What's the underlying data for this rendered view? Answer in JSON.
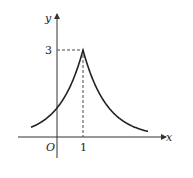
{
  "diagram": {
    "type": "function-graph",
    "function": "y = 3^(1-|x-1|)",
    "axes": {
      "x_label": "x",
      "y_label": "y",
      "origin_label": "O"
    },
    "marked_points": [
      {
        "x": 1,
        "y": 3,
        "x_tick_label": "1",
        "y_tick_label": "3"
      }
    ],
    "x_domain_shown": [
      -1,
      3.5
    ],
    "colors": {
      "curve": "#222222",
      "axes": "#333333",
      "dashed": "#333333"
    }
  }
}
